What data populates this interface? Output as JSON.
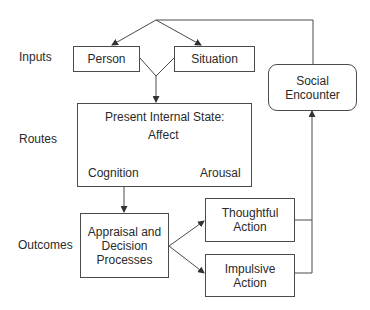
{
  "row_labels": {
    "inputs": "Inputs",
    "routes": "Routes",
    "outcomes": "Outcomes"
  },
  "nodes": {
    "person": "Person",
    "situation": "Situation",
    "social_encounter": "Social Encounter",
    "internal_state": {
      "title": "Present Internal State:",
      "affect": "Affect",
      "cognition": "Cognition",
      "arousal": "Arousal"
    },
    "appraisal": "Appraisal and Decision Processes",
    "thoughtful_action": "Thoughtful Action",
    "impulsive_action": "Impulsive Action"
  },
  "colors": {
    "line": "#4a4a4a",
    "text": "#2a2a2a",
    "background": "#ffffff"
  }
}
